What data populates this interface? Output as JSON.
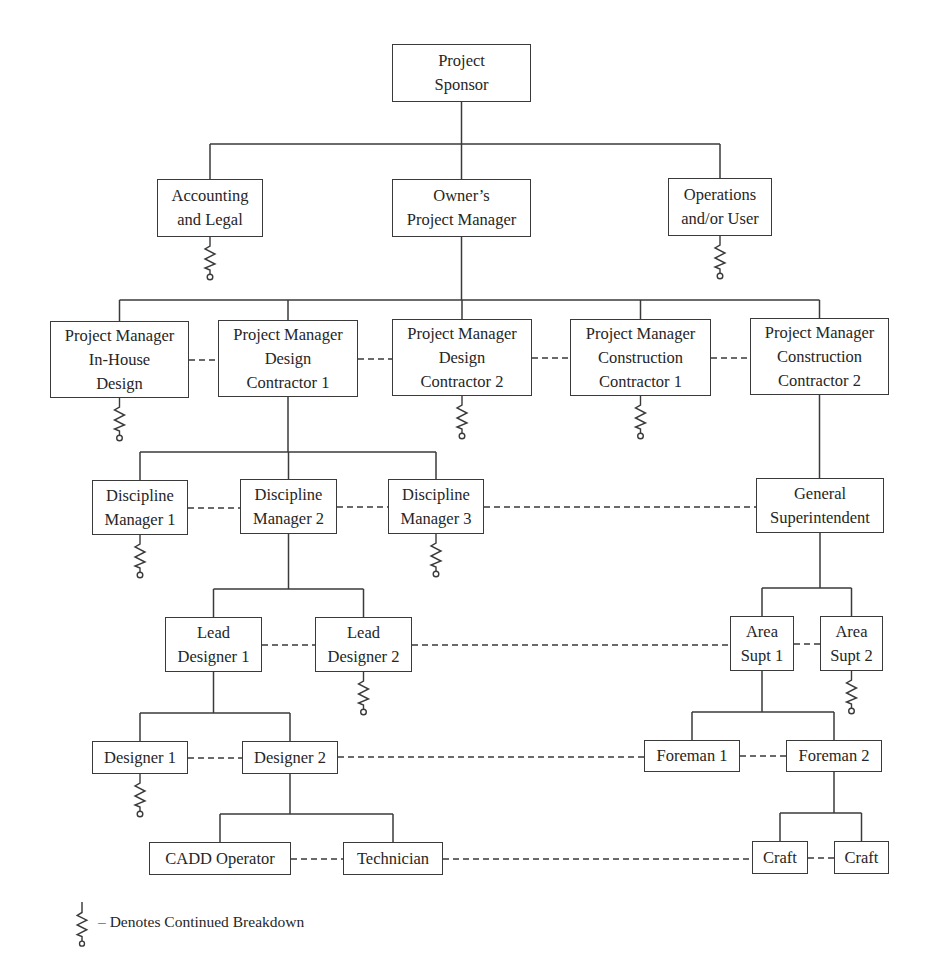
{
  "diagram": {
    "type": "organization-chart",
    "colors": {
      "line": "#3a3a3a",
      "text": "#262626",
      "background": "#ffffff"
    },
    "nodes": [
      {
        "id": "sponsor",
        "label": "Project\nSponsor",
        "x": 392,
        "y": 44,
        "w": 139,
        "h": 58
      },
      {
        "id": "accounting",
        "label": "Accounting\nand Legal",
        "x": 157,
        "y": 179,
        "w": 106,
        "h": 58,
        "continued": true
      },
      {
        "id": "owner_pm",
        "label": "Owner’s\nProject Manager",
        "x": 392,
        "y": 179,
        "w": 139,
        "h": 58
      },
      {
        "id": "operations",
        "label": "Operations\nand/or User",
        "x": 668,
        "y": 178,
        "w": 104,
        "h": 58,
        "continued": true
      },
      {
        "id": "pm_inhouse",
        "label": "Project Manager\nIn-House\nDesign",
        "x": 50,
        "y": 321,
        "w": 139,
        "h": 77,
        "continued": true
      },
      {
        "id": "pm_dc1",
        "label": "Project Manager\nDesign\nContractor 1",
        "x": 218,
        "y": 320,
        "w": 140,
        "h": 77
      },
      {
        "id": "pm_dc2",
        "label": "Project Manager\nDesign\nContractor 2",
        "x": 392,
        "y": 319,
        "w": 140,
        "h": 77,
        "continued": true
      },
      {
        "id": "pm_cc1",
        "label": "Project Manager\nConstruction\nContractor 1",
        "x": 570,
        "y": 319,
        "w": 141,
        "h": 77,
        "continued": true
      },
      {
        "id": "pm_cc2",
        "label": "Project Manager\nConstruction\nContractor 2",
        "x": 750,
        "y": 318,
        "w": 139,
        "h": 77
      },
      {
        "id": "dm1",
        "label": "Discipline\nManager 1",
        "x": 92,
        "y": 480,
        "w": 96,
        "h": 55,
        "continued": true
      },
      {
        "id": "dm2",
        "label": "Discipline\nManager 2",
        "x": 240,
        "y": 479,
        "w": 97,
        "h": 55
      },
      {
        "id": "dm3",
        "label": "Discipline\nManager 3",
        "x": 388,
        "y": 479,
        "w": 96,
        "h": 55,
        "continued": true
      },
      {
        "id": "gen_supt",
        "label": "General\nSuperintendent",
        "x": 756,
        "y": 478,
        "w": 128,
        "h": 55
      },
      {
        "id": "ld1",
        "label": "Lead\nDesigner 1",
        "x": 165,
        "y": 617,
        "w": 97,
        "h": 55
      },
      {
        "id": "ld2",
        "label": "Lead\nDesigner 2",
        "x": 315,
        "y": 617,
        "w": 97,
        "h": 55,
        "continued": true
      },
      {
        "id": "as1",
        "label": "Area\nSupt 1",
        "x": 730,
        "y": 616,
        "w": 64,
        "h": 55
      },
      {
        "id": "as2",
        "label": "Area\nSupt 2",
        "x": 820,
        "y": 616,
        "w": 63,
        "h": 55,
        "continued": true
      },
      {
        "id": "des1",
        "label": "Designer 1",
        "x": 92,
        "y": 741,
        "w": 96,
        "h": 33,
        "continued": true
      },
      {
        "id": "des2",
        "label": "Designer 2",
        "x": 242,
        "y": 741,
        "w": 96,
        "h": 33
      },
      {
        "id": "fore1",
        "label": "Foreman 1",
        "x": 644,
        "y": 740,
        "w": 96,
        "h": 32
      },
      {
        "id": "fore2",
        "label": "Foreman 2",
        "x": 786,
        "y": 740,
        "w": 96,
        "h": 32
      },
      {
        "id": "cadd",
        "label": "CADD Operator",
        "x": 149,
        "y": 842,
        "w": 142,
        "h": 33
      },
      {
        "id": "tech",
        "label": "Technician",
        "x": 343,
        "y": 842,
        "w": 100,
        "h": 33
      },
      {
        "id": "craft1",
        "label": "Craft",
        "x": 752,
        "y": 841,
        "w": 56,
        "h": 33
      },
      {
        "id": "craft2",
        "label": "Craft",
        "x": 834,
        "y": 841,
        "w": 55,
        "h": 33
      }
    ],
    "hierarchy": [
      {
        "parent": "sponsor",
        "children": [
          "accounting",
          "owner_pm",
          "operations"
        ],
        "bus_y": 144
      },
      {
        "parent": "owner_pm",
        "children": [
          "pm_inhouse",
          "pm_dc1",
          "pm_dc2",
          "pm_cc1",
          "pm_cc2"
        ],
        "bus_y": 300
      },
      {
        "parent": "pm_dc1",
        "children": [
          "dm1",
          "dm2",
          "dm3"
        ],
        "bus_y": 452
      },
      {
        "parent": "pm_cc2",
        "children": [
          "gen_supt"
        ],
        "bus_y": null
      },
      {
        "parent": "dm2",
        "children": [
          "ld1",
          "ld2"
        ],
        "bus_y": 589
      },
      {
        "parent": "gen_supt",
        "children": [
          "as1",
          "as2"
        ],
        "bus_y": 588
      },
      {
        "parent": "ld1",
        "children": [
          "des1",
          "des2"
        ],
        "bus_y": 713
      },
      {
        "parent": "as1",
        "children": [
          "fore1",
          "fore2"
        ],
        "bus_y": 712
      },
      {
        "parent": "des2",
        "children": [
          "cadd",
          "tech"
        ],
        "bus_y": 814
      },
      {
        "parent": "fore2",
        "children": [
          "craft1",
          "craft2"
        ],
        "bus_y": 813
      }
    ],
    "peer_links_dashed": [
      [
        "pm_inhouse",
        "pm_dc1"
      ],
      [
        "pm_dc1",
        "pm_dc2"
      ],
      [
        "pm_dc2",
        "pm_cc1"
      ],
      [
        "pm_cc1",
        "pm_cc2"
      ],
      [
        "dm1",
        "dm2"
      ],
      [
        "dm2",
        "dm3"
      ],
      [
        "dm3",
        "gen_supt"
      ],
      [
        "ld1",
        "ld2"
      ],
      [
        "ld2",
        "as1"
      ],
      [
        "as1",
        "as2"
      ],
      [
        "des1",
        "des2"
      ],
      [
        "des2",
        "fore1"
      ],
      [
        "fore1",
        "fore2"
      ],
      [
        "cadd",
        "tech"
      ],
      [
        "tech",
        "craft1"
      ],
      [
        "craft1",
        "craft2"
      ]
    ]
  },
  "legend": {
    "symbol": "continued-breakdown-icon",
    "text": "– Denotes Continued Breakdown"
  }
}
